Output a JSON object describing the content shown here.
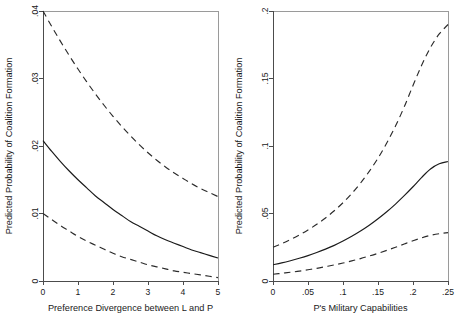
{
  "figure": {
    "background": "#ffffff",
    "line_color": "#1a1a1a",
    "frame_color": "#9a9a9a",
    "panel_count": 2
  },
  "chart_data": [
    {
      "type": "line",
      "panel": "left",
      "title": "",
      "xlabel": "Preference Divergence between L and P",
      "ylabel": "Predicted Probability of Coalition Formation",
      "xlim": [
        0,
        5
      ],
      "ylim": [
        0,
        0.04
      ],
      "xticks": [
        0,
        1,
        2,
        3,
        4,
        5
      ],
      "xticklabels": [
        "0",
        "1",
        "2",
        "3",
        "4",
        "5"
      ],
      "yticks": [
        0,
        0.01,
        0.02,
        0.03,
        0.04
      ],
      "yticklabels": [
        "0",
        ".01",
        ".02",
        ".03",
        ".04"
      ],
      "grid": false,
      "legend": "none",
      "x": [
        0,
        0.25,
        0.5,
        0.75,
        1,
        1.25,
        1.5,
        1.75,
        2,
        2.25,
        2.5,
        2.75,
        3,
        3.25,
        3.5,
        3.75,
        4,
        4.25,
        4.5,
        4.75,
        5
      ],
      "series": [
        {
          "name": "Upper 95% confidence bound",
          "style": "dashed",
          "values": [
            0.04,
            0.0377,
            0.0355,
            0.0334,
            0.0314,
            0.0295,
            0.0277,
            0.026,
            0.0244,
            0.0229,
            0.0215,
            0.0202,
            0.019,
            0.0179,
            0.0169,
            0.016,
            0.0152,
            0.0144,
            0.0137,
            0.0131,
            0.0125
          ]
        },
        {
          "name": "Predicted probability",
          "style": "solid",
          "values": [
            0.0208,
            0.0192,
            0.0177,
            0.0163,
            0.015,
            0.0138,
            0.0126,
            0.0116,
            0.0106,
            0.0097,
            0.0088,
            0.0081,
            0.0074,
            0.0067,
            0.0061,
            0.0056,
            0.0051,
            0.0046,
            0.0042,
            0.0038,
            0.0034
          ]
        },
        {
          "name": "Lower 95% confidence bound",
          "style": "dashed",
          "values": [
            0.01,
            0.0091,
            0.0082,
            0.0074,
            0.0066,
            0.0059,
            0.0053,
            0.0047,
            0.0041,
            0.0036,
            0.0032,
            0.0028,
            0.0024,
            0.0021,
            0.0018,
            0.0015,
            0.0013,
            0.0011,
            0.0009,
            0.0007,
            0.0005
          ]
        }
      ]
    },
    {
      "type": "line",
      "panel": "right",
      "title": "",
      "xlabel": "P's Military Capabilities",
      "ylabel": "Predicted Probability of Coalition Formation",
      "xlim": [
        0,
        0.25
      ],
      "ylim": [
        0,
        0.2
      ],
      "xticks": [
        0,
        0.05,
        0.1,
        0.15,
        0.2,
        0.25
      ],
      "xticklabels": [
        "0",
        ".05",
        ".1",
        ".15",
        ".2",
        ".25"
      ],
      "yticks": [
        0,
        0.05,
        0.1,
        0.15,
        0.2
      ],
      "yticklabels": [
        "0",
        ".05",
        ".1",
        ".15",
        ".2"
      ],
      "grid": false,
      "legend": "none",
      "x": [
        0,
        0.0125,
        0.025,
        0.0375,
        0.05,
        0.0625,
        0.075,
        0.0875,
        0.1,
        0.1125,
        0.125,
        0.1375,
        0.15,
        0.1625,
        0.175,
        0.1875,
        0.2,
        0.2125,
        0.225,
        0.2375,
        0.25
      ],
      "series": [
        {
          "name": "Upper 95% confidence bound",
          "style": "dashed",
          "values": [
            0.025,
            0.0277,
            0.0307,
            0.034,
            0.0378,
            0.042,
            0.0467,
            0.052,
            0.058,
            0.0648,
            0.0725,
            0.0812,
            0.091,
            0.1022,
            0.1148,
            0.129,
            0.1448,
            0.16,
            0.173,
            0.183,
            0.19
          ]
        },
        {
          "name": "Predicted probability",
          "style": "solid",
          "values": [
            0.012,
            0.0134,
            0.015,
            0.0168,
            0.0188,
            0.0211,
            0.0236,
            0.0264,
            0.0296,
            0.0331,
            0.037,
            0.0413,
            0.0461,
            0.0513,
            0.057,
            0.0632,
            0.0698,
            0.0768,
            0.083,
            0.0868,
            0.0885
          ]
        },
        {
          "name": "Lower 95% confidence bound",
          "style": "dashed",
          "values": [
            0.005,
            0.0057,
            0.0065,
            0.0073,
            0.0083,
            0.0094,
            0.0106,
            0.0119,
            0.0133,
            0.0149,
            0.0166,
            0.0185,
            0.0205,
            0.0227,
            0.025,
            0.0274,
            0.0298,
            0.032,
            0.0338,
            0.035,
            0.0358
          ]
        }
      ]
    }
  ],
  "panels": {
    "left": {
      "name": "preference-divergence-panel",
      "xlabel": "Preference Divergence between L and P",
      "ylabel": "Predicted Probability of Coalition Formation",
      "xticklabels": [
        "0",
        "1",
        "2",
        "3",
        "4",
        "5"
      ],
      "yticklabels": [
        "0",
        ".01",
        ".02",
        ".03",
        ".04"
      ]
    },
    "right": {
      "name": "military-capabilities-panel",
      "xlabel": "P's Military Capabilities",
      "ylabel": "Predicted Probability of Coalition Formation",
      "xticklabels": [
        "0",
        ".05",
        ".1",
        ".15",
        ".2",
        ".25"
      ],
      "yticklabels": [
        "0",
        ".05",
        ".1",
        ".15",
        ".2"
      ]
    }
  }
}
